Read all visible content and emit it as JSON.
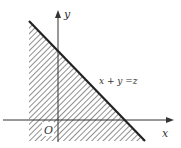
{
  "diagram": {
    "type": "linear-programming-region",
    "axes": {
      "x_label": "x",
      "y_label": "y",
      "origin_label": "O"
    },
    "line": {
      "equation_label": "x + y =z"
    },
    "shaded_region": "half-plane below line x + y = z, hatched",
    "colors": {
      "line": "#222222",
      "hatch": "#444444",
      "axis": "#333333",
      "background": "#ffffff"
    }
  }
}
